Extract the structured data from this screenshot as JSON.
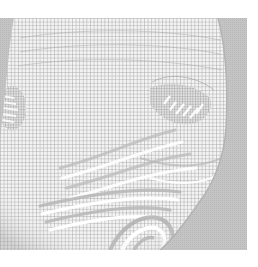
{
  "image": {
    "description": "Grayscale 3D wireframe mesh rendering of a human face",
    "subject": "face-mesh",
    "colors": {
      "page_background": "#ffffff",
      "backdrop_gray": "#c2c2c2",
      "mesh_cell": "#f4f4f4",
      "mesh_line": "#a9a9a9",
      "shadow_gray": "#b4b4b4"
    },
    "regions": [
      {
        "name": "forehead",
        "label": "forehead"
      },
      {
        "name": "left-eye",
        "label": "left eye"
      },
      {
        "name": "right-eye",
        "label": "right eye"
      },
      {
        "name": "nose",
        "label": "nose"
      },
      {
        "name": "mouth",
        "label": "mouth"
      },
      {
        "name": "chin",
        "label": "chin"
      },
      {
        "name": "cheek",
        "label": "cheek"
      }
    ]
  }
}
